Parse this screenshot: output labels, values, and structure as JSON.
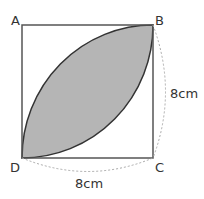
{
  "figure": {
    "vertices": {
      "A": {
        "label": "A"
      },
      "B": {
        "label": "B"
      },
      "C": {
        "label": "C"
      },
      "D": {
        "label": "D"
      }
    },
    "dimensions": {
      "right_side": "8cm",
      "bottom_side": "8cm"
    },
    "colors": {
      "shaded_region": "#b5b5b5",
      "square_stroke": "#555555",
      "arc_stroke": "#333333",
      "dashed_guide": "#aaaaaa"
    }
  }
}
